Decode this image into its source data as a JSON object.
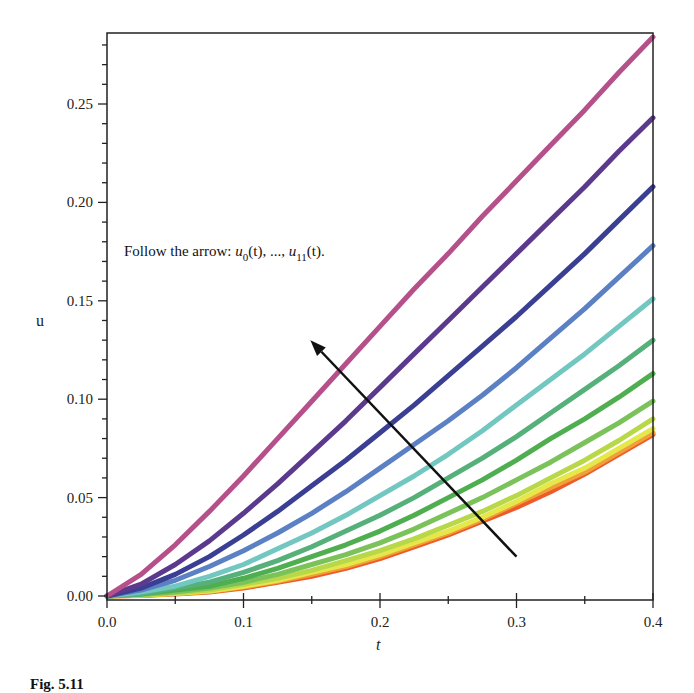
{
  "chart_data": {
    "type": "line",
    "title": "",
    "xlabel": "t",
    "ylabel": "u",
    "xlim": [
      0.0,
      0.4
    ],
    "ylim": [
      -0.002,
      0.288
    ],
    "grid": false,
    "legend": "none",
    "x_ticks": [
      "0.0",
      "0.1",
      "0.2",
      "0.3",
      "0.4"
    ],
    "y_ticks": [
      "0.00",
      "0.05",
      "0.10",
      "0.15",
      "0.20",
      "0.25"
    ],
    "annotation": {
      "text_prefix": "Follow the arrow: ",
      "u0": "u",
      "u0_sub": "0",
      "mid": "(t), ..., ",
      "u11": "u",
      "u11_sub": "11",
      "suffix": "(t).",
      "arrow_from": [
        0.3,
        0.02
      ],
      "arrow_to": [
        0.149,
        0.13
      ]
    },
    "x": [
      0.0,
      0.025,
      0.05,
      0.075,
      0.1,
      0.125,
      0.15,
      0.175,
      0.2,
      0.225,
      0.25,
      0.275,
      0.3,
      0.325,
      0.35,
      0.375,
      0.4
    ],
    "series": [
      {
        "name": "u11(t)",
        "color": "#b5508a",
        "values": [
          0.0,
          0.011,
          0.026,
          0.043,
          0.061,
          0.08,
          0.099,
          0.118,
          0.137,
          0.156,
          0.174,
          0.193,
          0.211,
          0.229,
          0.247,
          0.266,
          0.284
        ]
      },
      {
        "name": "u10(t)",
        "color": "#5b3a8e",
        "values": [
          0.0,
          0.006,
          0.016,
          0.028,
          0.042,
          0.057,
          0.073,
          0.089,
          0.106,
          0.123,
          0.14,
          0.157,
          0.174,
          0.191,
          0.208,
          0.226,
          0.243
        ]
      },
      {
        "name": "u9(t)",
        "color": "#3b3f94",
        "values": [
          0.0,
          0.004,
          0.011,
          0.02,
          0.031,
          0.043,
          0.056,
          0.069,
          0.083,
          0.097,
          0.112,
          0.127,
          0.142,
          0.158,
          0.174,
          0.191,
          0.208
        ]
      },
      {
        "name": "u8(t)",
        "color": "#5b80c4",
        "values": [
          0.0,
          0.003,
          0.008,
          0.015,
          0.023,
          0.032,
          0.042,
          0.053,
          0.065,
          0.077,
          0.089,
          0.102,
          0.116,
          0.131,
          0.146,
          0.162,
          0.178
        ]
      },
      {
        "name": "u7(t)",
        "color": "#72c7c0",
        "values": [
          0.0,
          0.002,
          0.005,
          0.01,
          0.016,
          0.024,
          0.032,
          0.041,
          0.051,
          0.061,
          0.072,
          0.084,
          0.097,
          0.11,
          0.123,
          0.137,
          0.151
        ]
      },
      {
        "name": "u6(t)",
        "color": "#55b07a",
        "values": [
          0.0,
          0.001,
          0.004,
          0.007,
          0.012,
          0.018,
          0.025,
          0.033,
          0.041,
          0.05,
          0.06,
          0.07,
          0.081,
          0.093,
          0.105,
          0.117,
          0.13
        ]
      },
      {
        "name": "u5(t)",
        "color": "#4fae4f",
        "values": [
          0.0,
          0.001,
          0.003,
          0.005,
          0.009,
          0.014,
          0.02,
          0.026,
          0.033,
          0.041,
          0.05,
          0.059,
          0.069,
          0.08,
          0.09,
          0.101,
          0.113
        ]
      },
      {
        "name": "u4(t)",
        "color": "#7bc25a",
        "values": [
          0.0,
          0.0008,
          0.002,
          0.004,
          0.007,
          0.011,
          0.016,
          0.021,
          0.027,
          0.034,
          0.042,
          0.05,
          0.059,
          0.068,
          0.078,
          0.088,
          0.099
        ]
      },
      {
        "name": "u3(t)",
        "color": "#b8d84a",
        "values": [
          0.0,
          0.0006,
          0.0016,
          0.003,
          0.006,
          0.009,
          0.013,
          0.018,
          0.023,
          0.029,
          0.036,
          0.043,
          0.051,
          0.06,
          0.069,
          0.079,
          0.09
        ]
      },
      {
        "name": "u2(t)",
        "color": "#e6e84a",
        "values": [
          0.0,
          0.0005,
          0.0013,
          0.0025,
          0.005,
          0.008,
          0.012,
          0.016,
          0.021,
          0.027,
          0.033,
          0.04,
          0.048,
          0.057,
          0.065,
          0.075,
          0.085
        ]
      },
      {
        "name": "u1(t)",
        "color": "#f0a038",
        "values": [
          0.0,
          0.0004,
          0.0012,
          0.0023,
          0.0045,
          0.0075,
          0.011,
          0.015,
          0.02,
          0.026,
          0.032,
          0.039,
          0.047,
          0.055,
          0.063,
          0.073,
          0.083
        ]
      },
      {
        "name": "u0(t)",
        "color": "#ee5a2a",
        "values": [
          0.0,
          0.0003,
          0.001,
          0.002,
          0.004,
          0.007,
          0.01,
          0.014,
          0.019,
          0.025,
          0.031,
          0.038,
          0.045,
          0.053,
          0.062,
          0.072,
          0.082
        ]
      }
    ]
  },
  "caption": "Fig. 5.11"
}
